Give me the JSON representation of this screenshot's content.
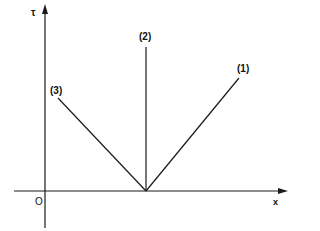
{
  "diagram": {
    "axes": {
      "y_label": "τ",
      "x_label": "x",
      "origin_label": "O"
    },
    "lines": [
      {
        "label": "(1)",
        "description": "line rising to the right from vertex"
      },
      {
        "label": "(2)",
        "description": "vertical line from vertex"
      },
      {
        "label": "(3)",
        "description": "line rising to the left from vertex"
      }
    ],
    "colors": {
      "stroke": "#1a1a1a",
      "background": "#ffffff"
    }
  }
}
